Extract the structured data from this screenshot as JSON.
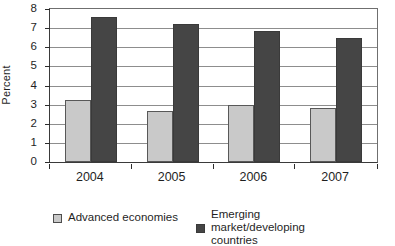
{
  "chart_data": {
    "type": "bar",
    "title": "",
    "subtitle": "",
    "xlabel": "",
    "ylabel": "Percent",
    "categories": [
      "2004",
      "2005",
      "2006",
      "2007"
    ],
    "ylim": [
      0,
      8
    ],
    "yticks": [
      0,
      1,
      2,
      3,
      4,
      5,
      6,
      7,
      8
    ],
    "ytick_labels": [
      "0",
      "1",
      "2",
      "3",
      "4",
      "5",
      "6",
      "7",
      "8"
    ],
    "grid": true,
    "legend_position": "bottom",
    "series": [
      {
        "name": "Advanced economies",
        "color": "#c9c9c9",
        "values": [
          3.25,
          2.65,
          3.0,
          2.8
        ]
      },
      {
        "name": "Emerging market/developing countries",
        "color": "#454545",
        "values": [
          7.6,
          7.2,
          6.85,
          6.5
        ]
      }
    ]
  },
  "legend": {
    "entries": [
      {
        "label": "Advanced economies",
        "swatch": "light-gray-swatch"
      },
      {
        "label": "Emerging\nmarket/developing\ncountries",
        "swatch": "dark-gray-swatch"
      }
    ]
  }
}
